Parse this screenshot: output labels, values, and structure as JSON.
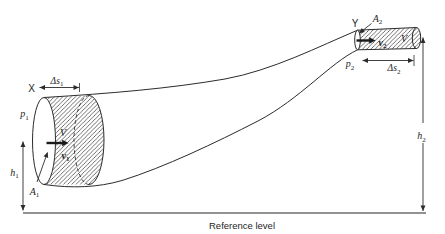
{
  "colors": {
    "background": "#ffffff",
    "line": "#2b2b2b",
    "text": "#1e1e1e"
  },
  "section_x": {
    "marker": "X",
    "pressure": {
      "base": "p",
      "sub": "1"
    },
    "area": {
      "base": "A",
      "sub": "1"
    },
    "velocity": {
      "base": "v",
      "sub": "1"
    },
    "volume": "V",
    "displacement": {
      "base": "Δs",
      "sub": "1"
    },
    "height": {
      "base": "h",
      "sub": "1"
    }
  },
  "section_y": {
    "marker": "Y",
    "pressure": {
      "base": "p",
      "sub": "2"
    },
    "area": {
      "base": "A",
      "sub": "2"
    },
    "velocity": {
      "base": "v",
      "sub": "2"
    },
    "volume": "V",
    "displacement": {
      "base": "Δs",
      "sub": "2"
    },
    "height": {
      "base": "h",
      "sub": "2"
    }
  },
  "baseline": {
    "label": "Reference level"
  }
}
